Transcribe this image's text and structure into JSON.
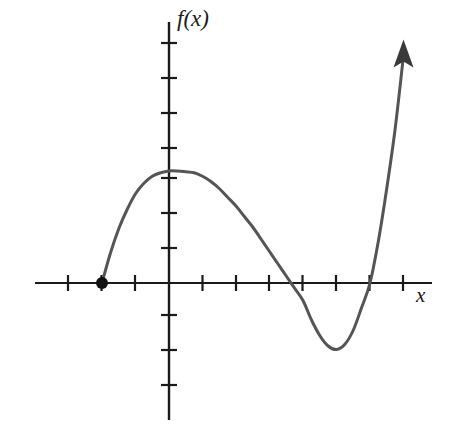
{
  "figure": {
    "width": 452,
    "height": 445,
    "background_color": "#ffffff",
    "axis_color": "#1a1a1a",
    "curve_color": "#555555",
    "point_color": "#111111"
  },
  "axes": {
    "x_axis_label": "x",
    "y_axis_label": "f(x)",
    "x_axis": {
      "origin_px": 169,
      "baseline_px": 283,
      "unit_px": 33.5,
      "start_px": 35,
      "end_px": 432,
      "tick_values": [
        -4,
        -3,
        -2,
        -1,
        1,
        2,
        3,
        4,
        5,
        6,
        7
      ],
      "tick_length_px": 16,
      "has_arrow": false
    },
    "y_axis": {
      "origin_px": 169,
      "baseline_px": 283,
      "unit_px": 35,
      "top_px": 22,
      "bottom_px": 420,
      "tick_values": [
        -4,
        -3,
        -2,
        1,
        2,
        3,
        4,
        5,
        6,
        7
      ],
      "tick_length_px": 16,
      "has_arrow": false
    },
    "gridlines": false,
    "tick_labels_shown": false
  },
  "chart_data": {
    "type": "line",
    "title": "",
    "xlabel": "x",
    "ylabel": "f(x)",
    "xlim": [
      -4,
      7.9
    ],
    "ylim": [
      -4.6,
      7.5
    ],
    "grid": false,
    "legend": false,
    "series": [
      {
        "name": "f(x)",
        "description": "Cubic-like polynomial curve with a double root at x = -2, a local maximum near x = 0.85, crossing the x-axis at x = 4, a local minimum near x = 5, crossing again at x = 6, then rising steeply with an upward arrow.",
        "x": [
          -2.0,
          -1.75,
          -1.5,
          -1.25,
          -1.0,
          -0.75,
          -0.5,
          -0.25,
          0.0,
          0.25,
          0.5,
          0.75,
          1.0,
          1.25,
          1.5,
          1.75,
          2.0,
          2.25,
          2.5,
          2.75,
          3.0,
          3.25,
          3.5,
          3.75,
          4.0,
          4.25,
          4.5,
          4.75,
          5.0,
          5.25,
          5.5,
          5.75,
          6.0,
          6.25,
          6.5,
          6.75,
          7.0
        ],
        "y": [
          0.0,
          0.85,
          1.55,
          2.1,
          2.55,
          2.85,
          3.05,
          3.15,
          3.2,
          3.2,
          3.18,
          3.15,
          3.05,
          2.9,
          2.7,
          2.45,
          2.2,
          1.9,
          1.6,
          1.25,
          0.9,
          0.55,
          0.2,
          -0.15,
          -0.5,
          -1.05,
          -1.5,
          -1.8,
          -1.9,
          -1.75,
          -1.35,
          -0.7,
          0.0,
          1.2,
          2.7,
          4.4,
          6.5
        ]
      }
    ],
    "annotations": [
      {
        "kind": "filled-point",
        "label": "left endpoint / root",
        "x": -2,
        "y": 0,
        "px": {
          "x": 102,
          "y": 283
        },
        "radius_px": 6
      },
      {
        "kind": "arrowhead",
        "label": "curve continues upward",
        "px": {
          "x": 402,
          "y": 47
        },
        "direction": "up"
      }
    ],
    "x_intercepts": [
      -2,
      4,
      6
    ],
    "y_intercept": 3.2,
    "local_maximum": {
      "x": 0.85,
      "y": 3.2
    },
    "local_minimum": {
      "x": 5.0,
      "y": -1.9
    }
  }
}
